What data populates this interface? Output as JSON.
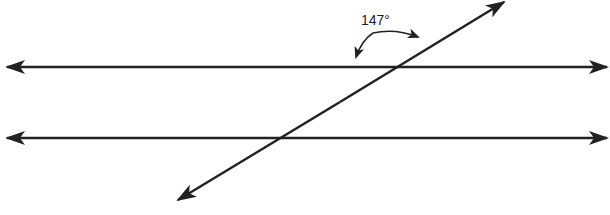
{
  "diagram": {
    "angle_label": "147°",
    "line_color": "#222222",
    "elements": {
      "parallel_lines": [
        "top-line",
        "bottom-line"
      ],
      "transversal": "transversal-line"
    }
  }
}
